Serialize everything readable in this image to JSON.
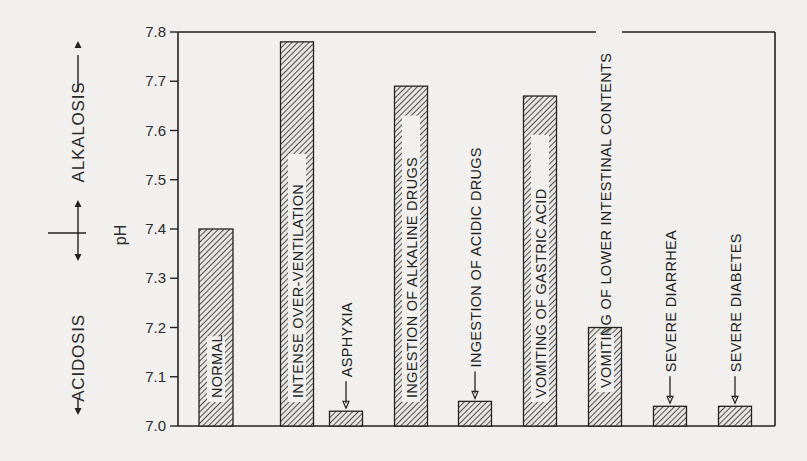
{
  "chart_data": {
    "type": "bar",
    "title": "",
    "xlabel": "",
    "ylabel": "pH",
    "ylim": [
      7.0,
      7.8
    ],
    "yticks": [
      "7.0",
      "7.1",
      "7.2",
      "7.3",
      "7.4",
      "7.5",
      "7.6",
      "7.7",
      "7.8"
    ],
    "grid": false,
    "legend": null,
    "categories": [
      "NORMAL",
      "INTENSE  OVER-VENTILATION",
      "ASPHYXIA",
      "INGESTION OF  ALKALINE  DRUGS",
      "INGESTION  OF  ACIDIC  DRUGS",
      "VOMITING  OF  GASTRIC  ACID",
      "VOMITING OF LOWER INTESTINAL CONTENTS",
      "SEVERE  DIARRHEA",
      "SEVERE  DIABETES"
    ],
    "values": [
      7.4,
      7.78,
      7.03,
      7.69,
      7.05,
      7.67,
      7.2,
      7.04,
      7.04
    ],
    "label_placement": [
      "inside",
      "inside",
      "above-arrow",
      "inside",
      "above-arrow",
      "inside",
      "inside-overflow",
      "above-arrow",
      "above-arrow"
    ],
    "side_annotations": {
      "acidosis": "ACIDOSIS",
      "alkalosis": "ALKALOSIS",
      "boundary_value": 7.4
    }
  }
}
